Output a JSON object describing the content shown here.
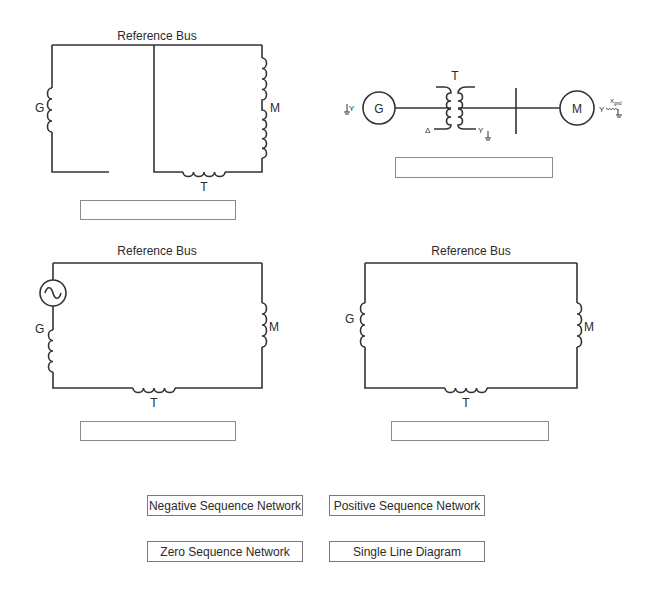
{
  "diagrams": {
    "top_left": {
      "title": "Reference Bus",
      "labels": {
        "generator": "G",
        "motor": "M",
        "transformer": "T"
      }
    },
    "single_line": {
      "generator": "G",
      "motor": "M",
      "transformer": "T",
      "gen_connection": "Y",
      "motor_connection": "Y",
      "xfmr_primary": "Δ",
      "xfmr_secondary": "Y",
      "ground_reactance": "X",
      "ground_reactance_sub": "gnd"
    },
    "bottom_left": {
      "title": "Reference Bus",
      "labels": {
        "generator": "G",
        "motor": "M",
        "transformer": "T"
      }
    },
    "bottom_right": {
      "title": "Reference Bus",
      "labels": {
        "generator": "G",
        "motor": "M",
        "transformer": "T"
      }
    }
  },
  "answer_boxes": [
    "",
    "",
    "",
    ""
  ],
  "choices": [
    {
      "label": "Negative Sequence Network"
    },
    {
      "label": "Positive Sequence Network"
    },
    {
      "label": "Zero Sequence Network"
    },
    {
      "label": "Single Line Diagram"
    }
  ]
}
